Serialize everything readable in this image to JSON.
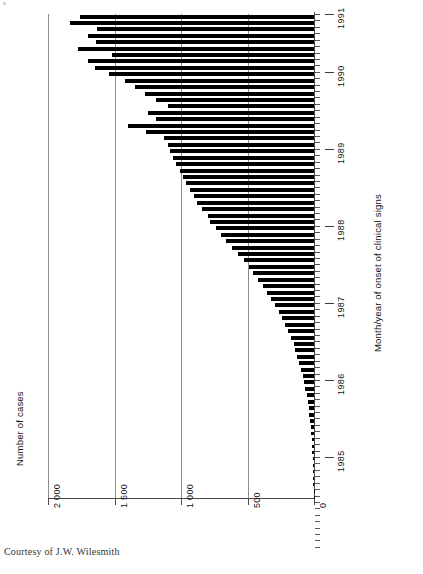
{
  "figure": {
    "credit": "Courtesy of J.W. Wilesmith",
    "value_axis_label": "Number of cases",
    "category_axis_label": "Month/year of onset of clinical signs"
  },
  "chart_data": {
    "type": "bar",
    "orientation": "horizontal-rotated",
    "title": "",
    "subtitle": "",
    "xlabel": "Month/year of onset of clinical signs",
    "ylabel": "Number of cases",
    "ylim": [
      0,
      2000
    ],
    "grid": true,
    "legend": null,
    "value_ticks": [
      {
        "value": 2000,
        "label": "2 000"
      },
      {
        "value": 1500,
        "label": "1 500"
      },
      {
        "value": 1000,
        "label": "1 000"
      },
      {
        "value": 500,
        "label": "500"
      },
      {
        "value": 0,
        "label": "0"
      }
    ],
    "year_ticks": [
      {
        "label": "1985",
        "month_index": 6
      },
      {
        "label": "1986",
        "month_index": 18
      },
      {
        "label": "1987",
        "month_index": 30
      },
      {
        "label": "1988",
        "month_index": 42
      },
      {
        "label": "1989",
        "month_index": 54
      },
      {
        "label": "1990",
        "month_index": 66
      },
      {
        "label": "1991",
        "month_index": 75
      }
    ],
    "categories": [
      "Jan 1985",
      "Feb 1985",
      "Mar 1985",
      "Apr 1985",
      "May 1985",
      "Jun 1985",
      "Jul 1985",
      "Aug 1985",
      "Sep 1985",
      "Oct 1985",
      "Nov 1985",
      "Dec 1985",
      "Jan 1986",
      "Feb 1986",
      "Mar 1986",
      "Apr 1986",
      "May 1986",
      "Jun 1986",
      "Jul 1986",
      "Aug 1986",
      "Sep 1986",
      "Oct 1986",
      "Nov 1986",
      "Dec 1986",
      "Jan 1987",
      "Feb 1987",
      "Mar 1987",
      "Apr 1987",
      "May 1987",
      "Jun 1987",
      "Jul 1987",
      "Aug 1987",
      "Sep 1987",
      "Oct 1987",
      "Nov 1987",
      "Dec 1987",
      "Jan 1988",
      "Feb 1988",
      "Mar 1988",
      "Apr 1988",
      "May 1988",
      "Jun 1988",
      "Jul 1988",
      "Aug 1988",
      "Sep 1988",
      "Oct 1988",
      "Nov 1988",
      "Dec 1988",
      "Jan 1989",
      "Feb 1989",
      "Mar 1989",
      "Apr 1989",
      "May 1989",
      "Jun 1989",
      "Jul 1989",
      "Aug 1989",
      "Sep 1989",
      "Oct 1989",
      "Nov 1989",
      "Dec 1989",
      "Jan 1990",
      "Feb 1990",
      "Mar 1990",
      "Apr 1990",
      "May 1990",
      "Jun 1990",
      "Jul 1990",
      "Aug 1990",
      "Sep 1990",
      "Oct 1990",
      "Nov 1990",
      "Dec 1990",
      "Jan 1991",
      "Feb 1991",
      "Mar 1991",
      "Apr 1991"
    ],
    "values": [
      2,
      3,
      4,
      5,
      6,
      8,
      10,
      12,
      14,
      16,
      20,
      24,
      28,
      34,
      40,
      48,
      56,
      64,
      72,
      84,
      96,
      110,
      125,
      140,
      150,
      175,
      195,
      215,
      240,
      265,
      290,
      320,
      350,
      385,
      420,
      455,
      490,
      530,
      575,
      620,
      660,
      700,
      740,
      780,
      800,
      845,
      880,
      905,
      935,
      960,
      985,
      1010,
      1035,
      1060,
      1080,
      1100,
      1125,
      1260,
      1400,
      1190,
      1245,
      1100,
      1190,
      1270,
      1345,
      1420,
      1540,
      1650,
      1700,
      1520,
      1775,
      1640,
      1700,
      1630,
      1835,
      1760
    ]
  }
}
